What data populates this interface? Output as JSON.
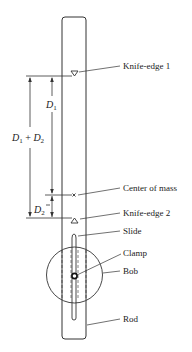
{
  "diagram": {
    "labels": {
      "knife_edge_1": "Knife-edge 1",
      "center_of_mass": "Center of mass",
      "knife_edge_2": "Knife-edge 2",
      "slide": "Slide",
      "clamp": "Clamp",
      "bob": "Bob",
      "rod": "Rod"
    },
    "dimensions": {
      "d1_main": "D",
      "d1_sub": "1",
      "d2_main": "D",
      "d2_sub": "2",
      "sum_d1_main": "D",
      "sum_d1_sub": "1",
      "sum_plus": " + ",
      "sum_d2_main": "D",
      "sum_d2_sub": "2"
    },
    "center_of_mass_marker": "×",
    "colors": {
      "line": "#333333",
      "text": "#222222",
      "background": "#ffffff"
    }
  }
}
